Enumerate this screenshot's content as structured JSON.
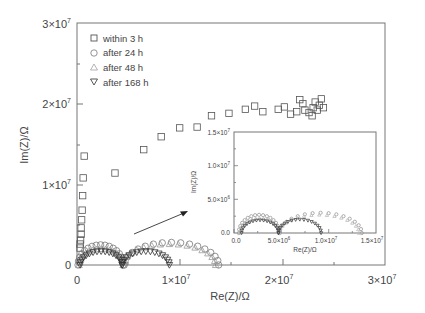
{
  "chart_data": [
    {
      "type": "scatter",
      "title": "",
      "xlabel": "Re(Z)/Ω",
      "ylabel": "Im(Z)/Ω",
      "xlim": [
        0,
        30000000
      ],
      "ylim": [
        0,
        30000000
      ],
      "x_ticks": [
        {
          "value": 0,
          "label": "0"
        },
        {
          "value": 10000000,
          "label": "1×10^7"
        },
        {
          "value": 20000000,
          "label": "2×10^7"
        },
        {
          "value": 30000000,
          "label": "3×10^7"
        }
      ],
      "y_ticks": [
        {
          "value": 0,
          "label": "0"
        },
        {
          "value": 10000000,
          "label": "1×10^7"
        },
        {
          "value": 20000000,
          "label": "2×10^7"
        },
        {
          "value": 30000000,
          "label": "3×10^7"
        }
      ],
      "grid": false,
      "legend_position": "upper-left",
      "series": [
        {
          "name": "within 3 h",
          "marker": "square",
          "color": "#555555",
          "points": [
            [
              300000.0,
              2100000.0
            ],
            [
              300000.0,
              2600000.0
            ],
            [
              350000.0,
              3100000.0
            ],
            [
              400000.0,
              3800000.0
            ],
            [
              400000.0,
              4600000.0
            ],
            [
              450000.0,
              5600000.0
            ],
            [
              500000.0,
              6800000.0
            ],
            [
              550000.0,
              8600000.0
            ],
            [
              600000.0,
              10800000.0
            ],
            [
              700000.0,
              13500000.0
            ],
            [
              3700000.0,
              11400000.0
            ],
            [
              6500000.0,
              14300000.0
            ],
            [
              8200000.0,
              15900000.0
            ],
            [
              10000000.0,
              17000000.0
            ],
            [
              11700000.0,
              17100000.0
            ],
            [
              13100000.0,
              18500000.0
            ],
            [
              14800000.0,
              18800000.0
            ],
            [
              16400000.0,
              19300000.0
            ],
            [
              17300000.0,
              19700000.0
            ],
            [
              18100000.0,
              19000000.0
            ],
            [
              19600000.0,
              19300000.0
            ],
            [
              20200000.0,
              19600000.0
            ],
            [
              20800000.0,
              18700000.0
            ],
            [
              21400000.0,
              19000000.0
            ],
            [
              21700000.0,
              20500000.0
            ],
            [
              22000000.0,
              20000000.0
            ],
            [
              22200000.0,
              19200000.0
            ],
            [
              22600000.0,
              18900000.0
            ],
            [
              22900000.0,
              18500000.0
            ],
            [
              23000000.0,
              19500000.0
            ],
            [
              23200000.0,
              20200000.0
            ],
            [
              23400000.0,
              19200000.0
            ],
            [
              23600000.0,
              19800000.0
            ],
            [
              23800000.0,
              20600000.0
            ],
            [
              24000000.0,
              19500000.0
            ]
          ]
        },
        {
          "name": "after 24 h",
          "marker": "circle",
          "color": "#777777",
          "arcs": [
            {
              "center_re": 2300000.0,
              "radius_re": 2300000.0,
              "peak_im": 2500000.0,
              "start_re": 100000.0,
              "end_re": 4500000.0
            },
            {
              "center_re": 9200000.0,
              "radius_re": 4600000.0,
              "peak_im": 2800000.0,
              "start_re": 4600000.0,
              "end_re": 13800000.0
            }
          ]
        },
        {
          "name": "after 48 h",
          "marker": "triangle-up",
          "color": "#9a9a9a",
          "arcs": [
            {
              "center_re": 2400000.0,
              "radius_re": 2300000.0,
              "peak_im": 2000000.0,
              "start_re": 200000.0,
              "end_re": 4500000.0
            },
            {
              "center_re": 9000000.0,
              "radius_re": 4500000.0,
              "peak_im": 2600000.0,
              "start_re": 4500000.0,
              "end_re": 13500000.0
            }
          ]
        },
        {
          "name": "after 168 h",
          "marker": "triangle-down",
          "color": "#333333",
          "arcs": [
            {
              "center_re": 2300000.0,
              "radius_re": 2200000.0,
              "peak_im": 1700000.0,
              "start_re": 300000.0,
              "end_re": 4400000.0
            },
            {
              "center_re": 6700000.0,
              "radius_re": 2300000.0,
              "peak_im": 1700000.0,
              "start_re": 4400000.0,
              "end_re": 9000000.0
            }
          ]
        }
      ],
      "annotations": [
        {
          "type": "arrow",
          "from": [
            5500000.0,
            3900000.0
          ],
          "to": [
            10700000.0,
            6600000.0
          ],
          "text": "points to inset"
        }
      ]
    },
    {
      "type": "scatter",
      "title": "inset (zoom of low-impedance region)",
      "xlabel": "Re(Z)/Ω",
      "ylabel": "Im(Z)/Ω",
      "xlim": [
        0,
        15000000
      ],
      "ylim": [
        0,
        15000000
      ],
      "x_ticks": [
        {
          "value": 0,
          "label": "0.0"
        },
        {
          "value": 5000000,
          "label": "5.0×10^6"
        },
        {
          "value": 10000000,
          "label": "1.0×10^7"
        },
        {
          "value": 15000000,
          "label": "1.5×10^7"
        }
      ],
      "y_ticks": [
        {
          "value": 0,
          "label": "0.0"
        },
        {
          "value": 5000000,
          "label": "5.0×10^6"
        },
        {
          "value": 10000000,
          "label": "1.0×10^7"
        },
        {
          "value": 15000000,
          "label": "1.5×10^7"
        }
      ],
      "grid": false,
      "series": [
        {
          "name": "after 24 h",
          "marker": "circle",
          "arcs": [
            {
              "start_re": 500000.0,
              "end_re": 4800000.0,
              "peak_im": 2700000.0
            },
            {
              "start_re": 4800000.0,
              "end_re": 13500000.0,
              "peak_im": 3000000.0
            }
          ]
        },
        {
          "name": "after 48 h",
          "marker": "triangle-up",
          "arcs": [
            {
              "start_re": 600000.0,
              "end_re": 4800000.0,
              "peak_im": 2200000.0
            },
            {
              "start_re": 4800000.0,
              "end_re": 13200000.0,
              "peak_im": 2700000.0
            }
          ]
        },
        {
          "name": "after 168 h",
          "marker": "triangle-down",
          "arcs": [
            {
              "start_re": 800000.0,
              "end_re": 4700000.0,
              "peak_im": 1900000.0
            },
            {
              "start_re": 4700000.0,
              "end_re": 9200000.0,
              "peak_im": 2000000.0
            }
          ]
        }
      ]
    }
  ],
  "main": {
    "xlabel": "Re(Z)/Ω",
    "ylabel": "Im(Z)/Ω",
    "x_tick_0": "0",
    "y_tick_0": "0",
    "tick_mantissa_1": "1×10",
    "tick_mantissa_2": "2×10",
    "tick_mantissa_3": "3×10",
    "tick_exp": "7"
  },
  "legend": [
    {
      "label": "within 3 h",
      "marker": "square"
    },
    {
      "label": "after 24 h",
      "marker": "circle"
    },
    {
      "label": "after 48 h",
      "marker": "triangle-up"
    },
    {
      "label": "after 168 h",
      "marker": "triangle-down"
    }
  ],
  "inset": {
    "xlabel": "Re(Z)/Ω",
    "ylabel": "Im(Z)/Ω",
    "x_ticks": [
      "0.0",
      "5.0×10",
      "1.0×10",
      "1.5×10"
    ],
    "x_exps": [
      "",
      "6",
      "7",
      "7"
    ],
    "y_ticks": [
      "0.0",
      "5.0×10",
      "1.0×10",
      "1.5×10"
    ],
    "y_exps": [
      "",
      "6",
      "7",
      "7"
    ]
  }
}
